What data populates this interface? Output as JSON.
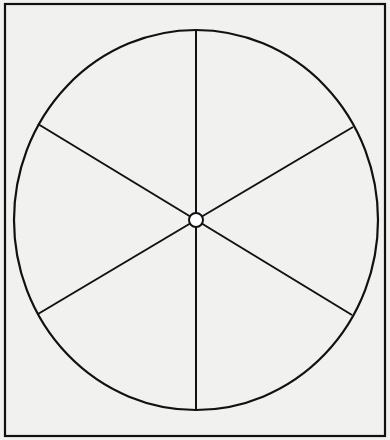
{
  "figure": {
    "shape": "spinner",
    "sections": 6,
    "labels": [],
    "colors": {
      "background": "#f1f1ef",
      "stroke": "#111111",
      "hub_fill": "#ffffff"
    },
    "frame": {
      "x": 5,
      "y": 4,
      "width": 380,
      "height": 432
    },
    "ellipse": {
      "cx": 196,
      "cy": 220,
      "rx": 182,
      "ry": 190
    },
    "hub": {
      "r": 7
    },
    "spokes": [
      {
        "x": 196,
        "y": 30
      },
      {
        "x": 353,
        "y": 127
      },
      {
        "x": 352,
        "y": 315
      },
      {
        "x": 196,
        "y": 410
      },
      {
        "x": 38,
        "y": 314
      },
      {
        "x": 38,
        "y": 124
      }
    ]
  }
}
